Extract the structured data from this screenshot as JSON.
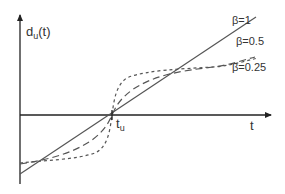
{
  "diagram": {
    "y_axis_label": {
      "base": "d",
      "subscript": "u",
      "suffix": "(t)"
    },
    "x_axis_label": "t",
    "crossing_label": {
      "base": "t",
      "subscript": "u"
    },
    "curves": [
      {
        "name": "beta-1",
        "label": "β=1",
        "style": "solid"
      },
      {
        "name": "beta-0.5",
        "label": "β=0.5",
        "style": "long-dash"
      },
      {
        "name": "beta-0.25",
        "label": "β=0.25",
        "style": "short-dash"
      }
    ],
    "colors": {
      "line": "#555555",
      "axis": "#222222",
      "text": "#333333"
    }
  }
}
